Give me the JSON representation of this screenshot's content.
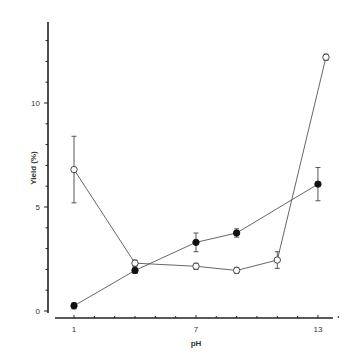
{
  "chart_data": {
    "type": "line",
    "title": "",
    "xlabel": "pH",
    "ylabel": "Yield (%)",
    "xlim": [
      0.1,
      14.7
    ],
    "ylim": [
      0,
      13.9
    ],
    "xticks": [
      1,
      7,
      13
    ],
    "xtick_minor_step": 1,
    "yticks": [
      0,
      5,
      10
    ],
    "ytick_minor_step": 1,
    "grid": false,
    "legend": null,
    "series": [
      {
        "name": "open circles",
        "marker": "open-circle",
        "x": [
          1,
          4,
          7,
          9,
          11,
          13
        ],
        "values": [
          6.8,
          2.3,
          2.15,
          1.95,
          2.45,
          12.2
        ],
        "error": [
          1.6,
          0.15,
          0.15,
          0.15,
          0.4,
          0.15
        ]
      },
      {
        "name": "filled circles",
        "marker": "filled-circle",
        "x": [
          1,
          4,
          7,
          9,
          13
        ],
        "values": [
          0.25,
          1.95,
          3.3,
          3.75,
          6.1
        ],
        "error": [
          0.15,
          0.15,
          0.45,
          0.2,
          0.8
        ]
      }
    ]
  }
}
